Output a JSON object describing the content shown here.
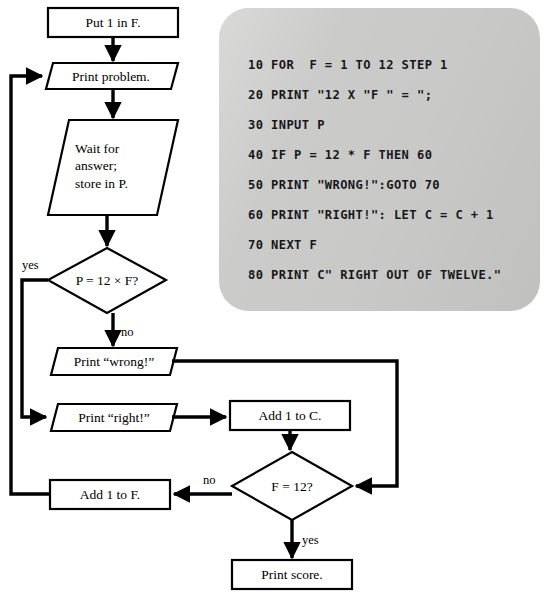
{
  "figure": {
    "background": "#ffffff",
    "line_color": "#000000"
  },
  "flowchart": {
    "nodes": [
      {
        "id": "put1inF",
        "shape": "process",
        "label": "Put 1 in F."
      },
      {
        "id": "printproblem",
        "shape": "input-output",
        "label": "Print problem."
      },
      {
        "id": "waitanswer",
        "shape": "input-output",
        "label": "Wait for\nanswer;\nstore in P."
      },
      {
        "id": "checkanswer",
        "shape": "decision",
        "label": "P = 12 × F?"
      },
      {
        "id": "printwrong",
        "shape": "input-output",
        "label": "Print “wrong!”"
      },
      {
        "id": "printright",
        "shape": "input-output",
        "label": "Print “right!”"
      },
      {
        "id": "add1toC",
        "shape": "process",
        "label": "Add 1 to C."
      },
      {
        "id": "checkF",
        "shape": "decision",
        "label": "F = 12?"
      },
      {
        "id": "add1toF",
        "shape": "process",
        "label": "Add 1 to F."
      },
      {
        "id": "printscore",
        "shape": "process",
        "label": "Print score."
      }
    ],
    "branch_labels": {
      "checkanswer_yes": "yes",
      "checkanswer_no": "no",
      "checkF_no": "no",
      "checkF_yes": "yes"
    }
  },
  "code_panel": {
    "background": "#c9c9c7",
    "lines": [
      "10 FOR  F = 1 TO 12 STEP 1",
      "20 PRINT \"12 X \"F \" = \";",
      "30 INPUT P",
      "40 IF P = 12 * F THEN 60",
      "50 PRINT \"WRONG!\":GOTO 70",
      "60 PRINT \"RIGHT!\": LET C = C + 1",
      "70 NEXT F",
      "80 PRINT C\" RIGHT OUT OF TWELVE.\""
    ]
  }
}
